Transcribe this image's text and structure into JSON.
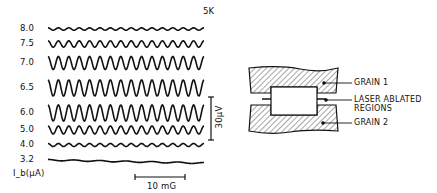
{
  "figure": {
    "temperature_label": "5K",
    "y_axis_label": "I_b(μA)",
    "scale_bar_voltage": "30μV",
    "scale_bar_field": "10 mG",
    "traces": [
      {
        "current": "8.0",
        "y": 29,
        "amp": 1.2,
        "cycles": 15
      },
      {
        "current": "7.5",
        "y": 44,
        "amp": 3.2,
        "cycles": 15
      },
      {
        "current": "7.0",
        "y": 63,
        "amp": 6.5,
        "cycles": 15
      },
      {
        "current": "6.5",
        "y": 88,
        "amp": 8,
        "cycles": 15
      },
      {
        "current": "6.0",
        "y": 113,
        "amp": 8,
        "cycles": 15
      },
      {
        "current": "5.0",
        "y": 130,
        "amp": 4,
        "cycles": 15
      },
      {
        "current": "4.0",
        "y": 145,
        "amp": 1.5,
        "cycles": 15
      },
      {
        "current": "3.2",
        "y": 160,
        "amp": 0.6,
        "cycles": 6
      }
    ]
  },
  "diagram": {
    "labels": {
      "grain1": "GRAIN 1",
      "laser_line1": "LASER ABLATED",
      "laser_line2": "REGIONS",
      "grain2": "GRAIN 2"
    }
  }
}
